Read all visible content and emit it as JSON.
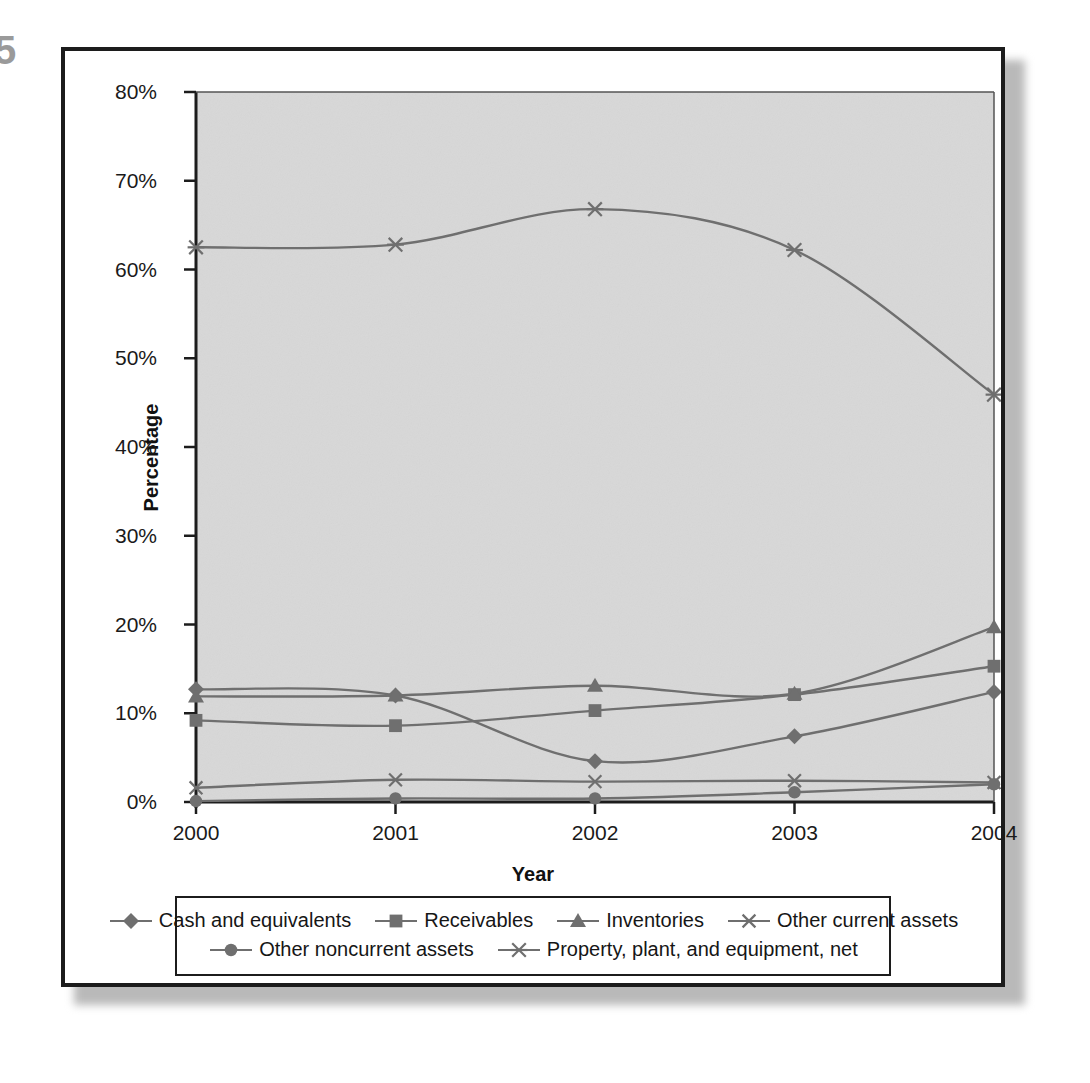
{
  "page_artifact": "5",
  "chart_data": {
    "type": "line",
    "title": "",
    "xlabel": "Year",
    "ylabel": "Percentage",
    "categories": [
      "2000",
      "2001",
      "2002",
      "2003",
      "2004"
    ],
    "x_tick_labels": [
      "2000",
      "2001",
      "2002",
      "2003",
      "2004"
    ],
    "y_tick_labels": [
      "0%",
      "10%",
      "20%",
      "30%",
      "40%",
      "50%",
      "60%",
      "70%",
      "80%"
    ],
    "y_tick_values": [
      0,
      10,
      20,
      30,
      40,
      50,
      60,
      70,
      80
    ],
    "ylim": [
      0,
      80
    ],
    "grid": false,
    "smoothed": true,
    "legend_position": "bottom",
    "plot_background": "#d8d8d8",
    "line_color": "#6f6f6f",
    "axis_color": "#1c1c1c",
    "series": [
      {
        "name": "Cash and equivalents",
        "marker": "diamond",
        "values": [
          12.7,
          12.0,
          4.6,
          7.4,
          12.4
        ]
      },
      {
        "name": "Receivables",
        "marker": "square",
        "values": [
          9.2,
          8.6,
          10.3,
          12.1,
          15.3
        ]
      },
      {
        "name": "Inventories",
        "marker": "triangle",
        "values": [
          11.9,
          12.0,
          13.1,
          12.2,
          19.7
        ]
      },
      {
        "name": "Other current assets",
        "marker": "cross",
        "values": [
          1.6,
          2.5,
          2.3,
          2.4,
          2.2
        ]
      },
      {
        "name": "Other noncurrent assets",
        "marker": "circle",
        "values": [
          0.1,
          0.4,
          0.4,
          1.1,
          2.0
        ]
      },
      {
        "name": "Property, plant, and equipment, net",
        "marker": "asterisk",
        "values": [
          62.5,
          62.8,
          66.8,
          62.2,
          45.9
        ]
      }
    ]
  }
}
